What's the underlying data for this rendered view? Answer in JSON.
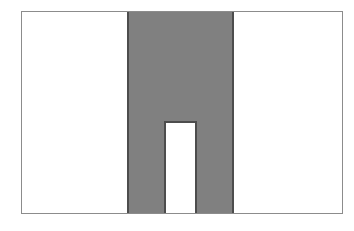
{
  "figure": {
    "title": "",
    "caption": "",
    "background_color": "#ffffff",
    "frame": {
      "name": "outer-border",
      "x": 21,
      "y": 11,
      "width": 322,
      "height": 203,
      "stroke_color": "#8c8c8c",
      "stroke_width": 1,
      "fill_color": "#ffffff"
    },
    "shape": {
      "name": "pi-shape",
      "description": "inverted U shape",
      "fill_color": "#808080",
      "stroke_color": "#4d4d4d",
      "stroke_width": 1,
      "geometry": {
        "head_left": 128,
        "head_right": 233,
        "head_top": 11,
        "head_bottom": 122,
        "left_leg_left": 128,
        "left_leg_right": 165,
        "right_leg_left": 196,
        "right_leg_right": 233,
        "leg_bottom": 213,
        "notch_left": 165,
        "notch_right": 196,
        "notch_top": 122,
        "notch_bottom": 213,
        "notch_fill_color": "#ffffff"
      }
    }
  },
  "chart_data": {
    "type": "area",
    "title": "",
    "xlabel": "",
    "ylabel": "",
    "grid": false,
    "legend": "none",
    "xlim": [
      21,
      343
    ],
    "ylim": [
      11,
      214
    ],
    "series": [
      {
        "name": "pi-shape",
        "fill": "#808080",
        "stroke": "#4d4d4d",
        "polygon": [
          [
            128,
            11
          ],
          [
            233,
            11
          ],
          [
            233,
            213
          ],
          [
            196,
            213
          ],
          [
            196,
            122
          ],
          [
            165,
            122
          ],
          [
            165,
            213
          ],
          [
            128,
            213
          ]
        ]
      }
    ],
    "annotations": []
  }
}
